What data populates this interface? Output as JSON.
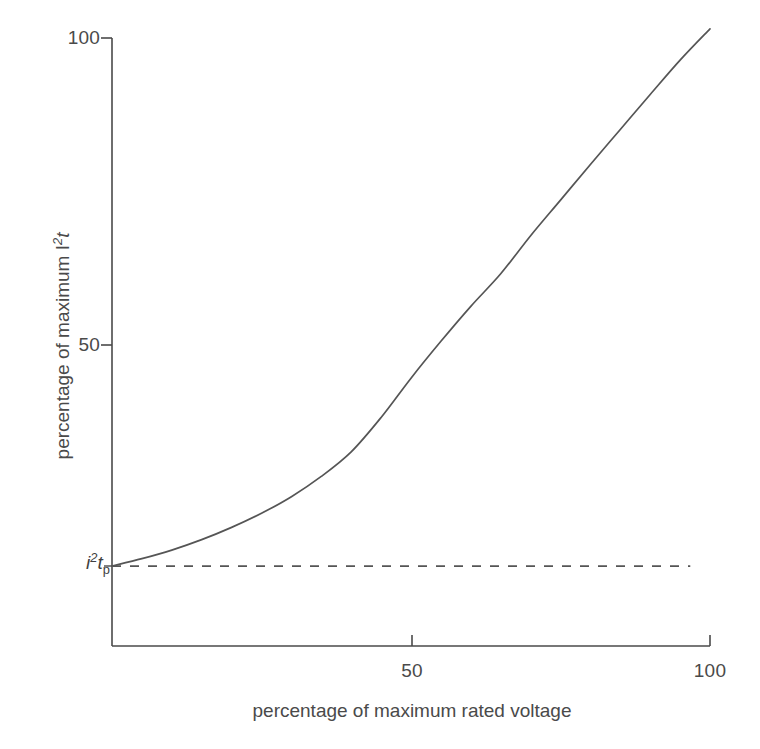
{
  "chart_data": {
    "type": "line",
    "title": "",
    "xlabel": "percentage of maximum rated voltage",
    "ylabel_text": "percentage of maximum I",
    "ylabel_sup": "2",
    "ylabel_tail": "t",
    "xlim": [
      0,
      100
    ],
    "ylim": [
      0,
      100
    ],
    "grid": false,
    "legend": "none",
    "xticks": [
      {
        "value": 50,
        "label": "50"
      },
      {
        "value": 100,
        "label": "100"
      }
    ],
    "yticks": [
      {
        "value": 50,
        "label": "50"
      },
      {
        "value": 100,
        "label": "100"
      }
    ],
    "annotations": [
      {
        "name": "baseline-level",
        "base": "i",
        "sup": "2",
        "mid": "t",
        "sub": "p",
        "y_value": 14,
        "description": "peak let-through i squared t p baseline level"
      }
    ],
    "series": [
      {
        "name": "i2t-curve",
        "style": "solid",
        "color": "#555555",
        "x": [
          0,
          5,
          10,
          15,
          20,
          25,
          30,
          35,
          40,
          45,
          50,
          55,
          60,
          65,
          70,
          75,
          80,
          85,
          90,
          95,
          100
        ],
        "y": [
          14,
          15.2,
          16.6,
          18.3,
          20.3,
          22.6,
          25.3,
          28.6,
          32.6,
          38.2,
          44.6,
          50.6,
          56.3,
          61.6,
          67.8,
          73.6,
          79.4,
          85.1,
          90.8,
          96.4,
          101.5
        ]
      },
      {
        "name": "baseline-dashed",
        "style": "dashed",
        "color": "#555555",
        "x": [
          0,
          100
        ],
        "y": [
          14,
          14
        ]
      }
    ]
  },
  "axes": {
    "x_tick_50": "50",
    "x_tick_100": "100",
    "y_tick_50": "50",
    "y_tick_100": "100",
    "x_axis_title": "percentage of maximum rated voltage"
  },
  "colors": {
    "line": "#555555",
    "axis": "#4a4a4a",
    "text": "#4a4a4a",
    "background": "#ffffff"
  }
}
